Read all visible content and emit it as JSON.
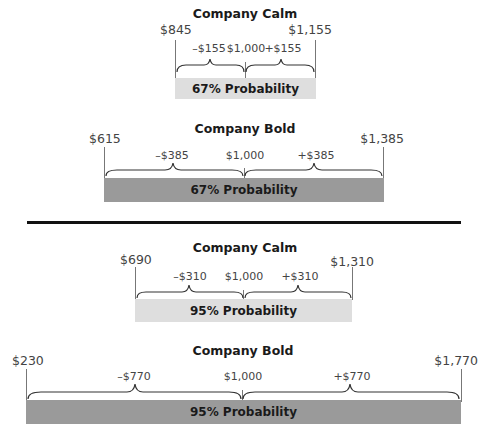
{
  "panels": [
    {
      "title": "Company Calm",
      "low": "$845",
      "high": "$1,155",
      "minus": "–$155",
      "center": "$1,000",
      "plus": "+$155",
      "probability": "67% Probability",
      "style": "light"
    },
    {
      "title": "Company Bold",
      "low": "$615",
      "high": "$1,385",
      "minus": "–$385",
      "center": "$1,000",
      "plus": "+$385",
      "probability": "67% Probability",
      "style": "dark"
    },
    {
      "title": "Company Calm",
      "low": "$690",
      "high": "$1,310",
      "minus": "–$310",
      "center": "$1,000",
      "plus": "+$310",
      "probability": "95% Probability",
      "style": "light"
    },
    {
      "title": "Company Bold",
      "low": "$230",
      "high": "$1,770",
      "minus": "–$770",
      "center": "$1,000",
      "plus": "+$770",
      "probability": "95% Probability",
      "style": "dark"
    }
  ],
  "colors": {
    "light_bar": "#dedede",
    "dark_bar": "#9a9a9a",
    "divider": "#111111"
  }
}
